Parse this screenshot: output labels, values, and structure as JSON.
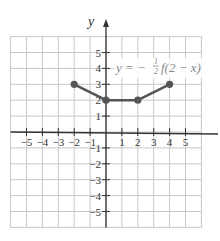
{
  "chart_data": {
    "type": "line",
    "title": "",
    "annotation": "y = −½ f(2 − x)",
    "xlabel": "",
    "ylabel": "y",
    "x": [
      -2,
      0,
      2,
      4
    ],
    "y": [
      3,
      2,
      2,
      3
    ],
    "series": [
      {
        "name": "y = −½ f(2 − x)",
        "points": [
          [
            -2,
            3
          ],
          [
            0,
            2
          ],
          [
            2,
            2
          ],
          [
            4,
            3
          ]
        ]
      }
    ],
    "xlim": [
      -6,
      6
    ],
    "ylim": [
      -6,
      6
    ],
    "x_ticks": [
      "-5",
      "-4",
      "-3",
      "-2",
      "-1",
      "1",
      "2",
      "3",
      "4",
      "5"
    ],
    "y_ticks": [
      "5",
      "4",
      "3",
      "2",
      "1",
      "-1",
      "-2",
      "-3",
      "-4",
      "-5"
    ],
    "grid": true,
    "colors": {
      "line": "#555555",
      "grid": "#c8c8c8",
      "axis": "#333333",
      "annotation": "#8a8a8a"
    }
  },
  "labels": {
    "y_axis": "y",
    "equation_prefix": "y = −",
    "equation_frac_num": "1",
    "equation_frac_den": "2",
    "equation_suffix": "f(2 − x)"
  }
}
